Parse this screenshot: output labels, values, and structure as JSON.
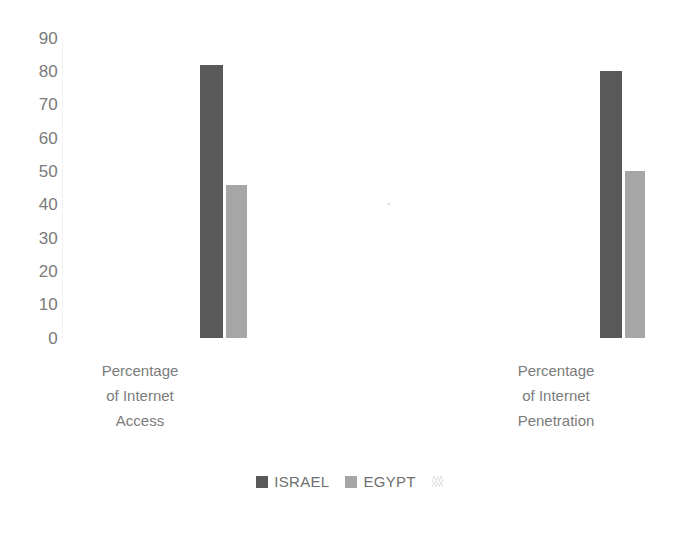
{
  "chart_data": {
    "type": "bar",
    "title": "",
    "subtitle": "",
    "xlabel": "",
    "ylabel": "",
    "ylim": [
      0,
      90
    ],
    "y_ticks": [
      90,
      80,
      70,
      60,
      50,
      40,
      30,
      20,
      10,
      0
    ],
    "grid": false,
    "legend_position": "bottom",
    "categories": [
      "Percentage of Internet Access",
      "Percentage of Internet Penetration"
    ],
    "category_label_lines": [
      [
        "Percentage",
        "of Internet",
        "Access"
      ],
      [
        "Percentage",
        "of Internet",
        "Penetration"
      ]
    ],
    "series": [
      {
        "name": "ISRAEL",
        "color": "#595959",
        "values": [
          82,
          80
        ]
      },
      {
        "name": "EGYPT",
        "color": "#a6a6a6",
        "values": [
          46,
          50
        ]
      }
    ]
  },
  "legend": {
    "entries": [
      {
        "label": "ISRAEL",
        "color": "#595959"
      },
      {
        "label": "EGYPT",
        "color": "#a6a6a6"
      }
    ],
    "artifact_name": "legend-smudge-artifact"
  },
  "colors": {
    "series_israel": "#595959",
    "series_egypt": "#a6a6a6",
    "tick_text": "#7b7b7b",
    "category_text": "#7b7b7b",
    "legend_text": "#6f6f6f",
    "axis_line": "#f2f2f2",
    "background": "#ffffff"
  }
}
